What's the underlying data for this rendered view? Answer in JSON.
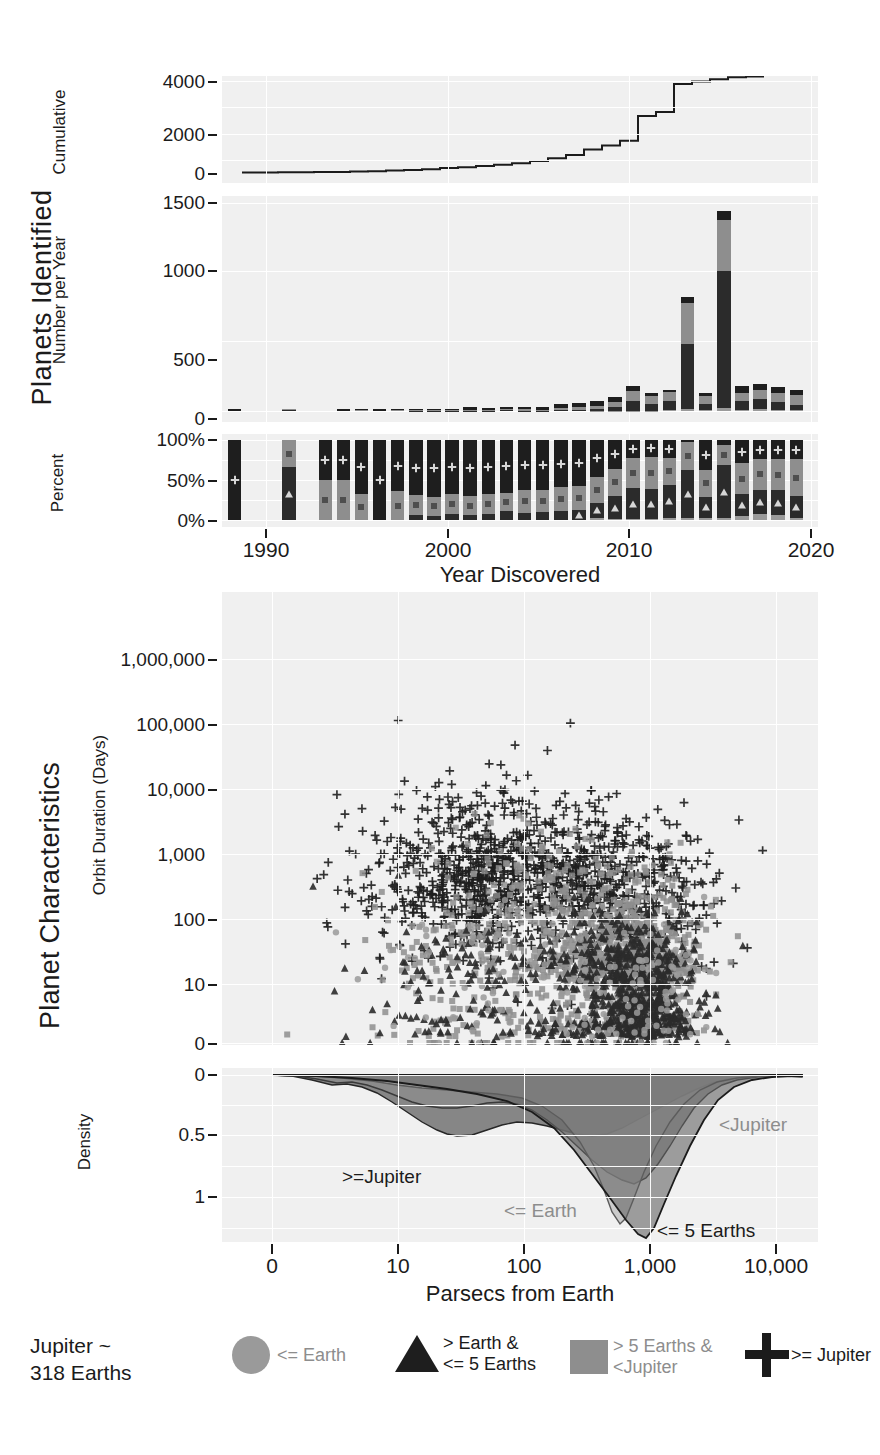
{
  "supertitles": {
    "top": "Planets  Identified",
    "bottom": "Planet Characteristics"
  },
  "panel_cumulative": {
    "ylabel": "Cumulative",
    "yticks": [
      "4000",
      "2000",
      "0"
    ],
    "ylim": [
      0,
      4400
    ]
  },
  "panel_peryear": {
    "ylabel": "Number per Year",
    "yticks": [
      "1500",
      "1000",
      "500",
      "0"
    ],
    "ylim": [
      0,
      1560
    ]
  },
  "panel_percent": {
    "ylabel": "Percent",
    "yticks": [
      "100%",
      "50%",
      "0%"
    ],
    "ylim": [
      0,
      100
    ]
  },
  "panel_top_xaxis": {
    "title": "Year Discovered",
    "ticks": [
      "1990",
      "2000",
      "2010",
      "2020"
    ],
    "xlim": [
      1988.3,
      2021.2
    ]
  },
  "panel_scatter": {
    "ylabel": "Orbit Duration (Days)",
    "yticks": [
      "1,000,000",
      "100,000",
      "10,000",
      "1,000",
      "100",
      "10",
      "0"
    ]
  },
  "panel_density": {
    "ylabel": "Density",
    "yticks": [
      "0",
      "0.5",
      "1"
    ],
    "inline_labels": [
      {
        "text": ">=Jupiter",
        "tone": "dark"
      },
      {
        "text": "<Jupiter",
        "tone": "grey"
      },
      {
        "text": "<= Earth",
        "tone": "grey"
      },
      {
        "text": "<= 5 Earths",
        "tone": "dark"
      }
    ]
  },
  "panel_bottom_xaxis": {
    "title": "Parsecs from Earth",
    "ticks": [
      "0",
      "10",
      "100",
      "1,000",
      "10,000"
    ]
  },
  "footnote": "Jupiter ~\n318 Earths",
  "legend": [
    {
      "icon": "circle-marker-icon",
      "label": "<= Earth",
      "tone": "grey",
      "color": "#9a9a9a"
    },
    {
      "icon": "triangle-marker-icon",
      "label": "> Earth &\n<= 5 Earths",
      "tone": "dark",
      "color": "#1e1e1e"
    },
    {
      "icon": "square-marker-icon",
      "label": "> 5 Earths &\n<Jupiter",
      "tone": "grey",
      "color": "#8e8e8e"
    },
    {
      "icon": "plus-marker-icon",
      "label": ">= Jupiter",
      "tone": "dark",
      "color": "#1b1b1b"
    }
  ],
  "colors": {
    "panel_bg": "#f0f0f0",
    "grid": "#ffffff",
    "earth": "#9a9a9a",
    "five_earths": "#2b2b2b",
    "sub_jupiter": "#8e8e8e",
    "jupiter": "#1e1e1e",
    "ink": "#1b1b1b"
  },
  "chart_data": {
    "type": "bar",
    "panels": [
      {
        "id": "cumulative",
        "type": "line",
        "ylabel": "Cumulative",
        "xlabel": "Year Discovered",
        "ylim": [
          0,
          4400
        ],
        "grid": true,
        "x": [
          1989,
          1990,
          1991,
          1992,
          1993,
          1994,
          1995,
          1996,
          1997,
          1998,
          1999,
          2000,
          2001,
          2002,
          2003,
          2004,
          2005,
          2006,
          2007,
          2008,
          2009,
          2010,
          2011,
          2012,
          2013,
          2014,
          2015,
          2016,
          2017,
          2018,
          2019,
          2020
        ],
        "values": [
          1,
          1,
          1,
          3,
          3,
          3,
          4,
          10,
          11,
          22,
          38,
          55,
          67,
          98,
          123,
          156,
          188,
          217,
          269,
          330,
          406,
          514,
          703,
          841,
          1000,
          1856,
          1989,
          3482,
          3670,
          3820,
          3960,
          4070
        ]
      },
      {
        "id": "per_year",
        "type": "stacked-bar",
        "ylabel": "Number per Year",
        "xlabel": "Year Discovered",
        "ylim": [
          0,
          1560
        ],
        "grid": true,
        "categories": [
          1989,
          1990,
          1991,
          1992,
          1993,
          1994,
          1995,
          1996,
          1997,
          1998,
          1999,
          2000,
          2001,
          2002,
          2003,
          2004,
          2005,
          2006,
          2007,
          2008,
          2009,
          2010,
          2011,
          2012,
          2013,
          2014,
          2015,
          2016,
          2017,
          2018,
          2019,
          2020
        ],
        "series": [
          {
            "name": "<= Earth",
            "values": [
              0,
              0,
              0,
              0,
              0,
              0,
              0,
              0,
              0,
              0,
              0,
              0,
              0,
              0,
              0,
              0,
              0,
              0,
              0,
              0,
              1,
              1,
              2,
              2,
              4,
              12,
              5,
              22,
              10,
              14,
              10,
              6
            ]
          },
          {
            "name": "> Earth & <= 5 Earths",
            "values": [
              0,
              0,
              0,
              2,
              0,
              0,
              0,
              0,
              0,
              0,
              1,
              1,
              1,
              2,
              2,
              4,
              3,
              3,
              6,
              8,
              14,
              32,
              76,
              52,
              74,
              489,
              46,
              1026,
              62,
              75,
              60,
              41
            ]
          },
          {
            "name": "> 5 Earths & <Jupiter",
            "values": [
              0,
              0,
              0,
              1,
              0,
              0,
              0,
              2,
              0,
              4,
              4,
              5,
              3,
              8,
              8,
              9,
              10,
              8,
              16,
              19,
              26,
              38,
              72,
              55,
              62,
              310,
              59,
              382,
              66,
              70,
              63,
              70
            ]
          },
          {
            "name": ">= Jupiter",
            "values": [
              1,
              0,
              0,
              0,
              0,
              0,
              1,
              4,
              1,
              7,
              11,
              11,
              7,
              21,
              15,
              20,
              19,
              18,
              30,
              34,
              35,
              37,
              39,
              29,
              19,
              45,
              23,
              69,
              50,
              46,
              47,
              43
            ]
          }
        ]
      },
      {
        "id": "percent",
        "type": "percent-stacked-bar",
        "ylabel": "Percent",
        "xlabel": "Year Discovered",
        "ylim": [
          0,
          100
        ],
        "grid": true,
        "categories": [
          1989,
          1992,
          1994,
          1995,
          1996,
          1997,
          1998,
          1999,
          2000,
          2001,
          2002,
          2003,
          2004,
          2005,
          2006,
          2007,
          2008,
          2009,
          2010,
          2011,
          2012,
          2013,
          2014,
          2015,
          2016,
          2017,
          2018,
          2019,
          2020
        ],
        "series": [
          {
            "name": "<= Earth",
            "values": [
              0,
              0,
              0,
              0,
              0,
              0,
              0,
              0,
              0,
              0,
              0,
              0,
              0,
              0,
              0,
              0,
              0,
              3,
              1,
              1,
              1,
              3,
              2,
              3,
              2,
              5,
              7,
              6,
              3
            ]
          },
          {
            "name": "> Earth & <= 5 Earths",
            "values": [
              0,
              66,
              0,
              0,
              0,
              0,
              0,
              6,
              5,
              8,
              6,
              7,
              11,
              9,
              10,
              11,
              13,
              18,
              29,
              39,
              38,
              41,
              61,
              26,
              67,
              27,
              31,
              31,
              27
            ]
          },
          {
            "name": "> 5 Earths & <Jupiter",
            "values": [
              0,
              34,
              50,
              50,
              33,
              0,
              36,
              25,
              24,
              25,
              24,
              26,
              23,
              29,
              27,
              30,
              30,
              33,
              34,
              37,
              40,
              34,
              35,
              34,
              25,
              39,
              38,
              39,
              46
            ]
          },
          {
            "name": ">= Jupiter",
            "values": [
              100,
              0,
              50,
              50,
              67,
              100,
              64,
              69,
              71,
              67,
              70,
              67,
              66,
              62,
              63,
              59,
              57,
              46,
              36,
              23,
              21,
              22,
              2,
              37,
              6,
              29,
              24,
              24,
              24
            ]
          }
        ]
      },
      {
        "id": "scatter",
        "type": "scatter",
        "xlabel": "Parsecs from Earth",
        "ylabel": "Orbit Duration (Days)",
        "xscale": "log",
        "yscale": "log",
        "xticks": [
          0,
          10,
          100,
          1000,
          10000
        ],
        "yticks": [
          0,
          10,
          100,
          1000,
          10000,
          100000,
          1000000
        ],
        "grid": true,
        "series": [
          {
            "name": "<= Earth",
            "marker": "circle",
            "color": "#9a9a9a",
            "approx_count": 180
          },
          {
            "name": "> Earth & <= 5 Earths",
            "marker": "triangle",
            "color": "#1e1e1e",
            "approx_count": 900
          },
          {
            "name": "> 5 Earths & <Jupiter",
            "marker": "square",
            "color": "#8e8e8e",
            "approx_count": 1100
          },
          {
            "name": ">= Jupiter",
            "marker": "plus",
            "color": "#1b1b1b",
            "approx_count": 1100
          }
        ],
        "notes": "Dense clusters: Jupiter-class crosses near 300-3000 days across 10-3000 pc; small-planet triangles/squares concentrate 1-100 days around 300-2000 pc."
      },
      {
        "id": "density",
        "type": "area",
        "xlabel": "Parsecs from Earth",
        "ylabel": "Density",
        "xscale": "log",
        "ylim": [
          0,
          1.35
        ],
        "inverted_y": true,
        "grid": true,
        "series": [
          {
            "name": ">= Jupiter",
            "peak_x": 60,
            "peak_density": 0.55
          },
          {
            "name": "<Jupiter",
            "peak_x": 1000,
            "peak_density": 0.72
          },
          {
            "name": "<= Earth",
            "peak_x": 800,
            "peak_density": 1.18
          },
          {
            "name": "<= 5 Earths",
            "peak_x": 1000,
            "peak_density": 1.3
          }
        ]
      }
    ]
  }
}
